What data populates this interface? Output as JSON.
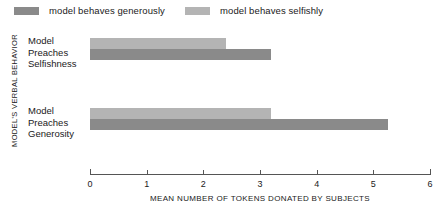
{
  "legend": {
    "items": [
      {
        "label": "model behaves generously",
        "color": "#8a8a8a",
        "series_key": "generously"
      },
      {
        "label": "model behaves selfishly",
        "color": "#b4b4b4",
        "series_key": "selfishly"
      }
    ]
  },
  "chart_data": {
    "type": "bar",
    "orientation": "horizontal",
    "title": "",
    "xlabel": "MEAN NUMBER OF TOKENS DONATED BY SUBJECTS",
    "ylabel": "MODEL'S VERBAL BEHAVIOR",
    "categories": [
      "Model Preaches Selfishness",
      "Model Preaches Generosity"
    ],
    "series": [
      {
        "name": "model behaves generously",
        "color": "#8a8a8a",
        "values": [
          3.2,
          5.25
        ]
      },
      {
        "name": "model behaves selfishly",
        "color": "#b4b4b4",
        "values": [
          2.4,
          3.2
        ]
      }
    ],
    "xlim": [
      0,
      6
    ],
    "xticks": [
      0,
      1,
      2,
      3,
      4,
      5,
      6
    ],
    "xticklabels": [
      "0",
      "1",
      "2",
      "3",
      "4",
      "5",
      "6"
    ],
    "grid": false,
    "legend_position": "top"
  }
}
